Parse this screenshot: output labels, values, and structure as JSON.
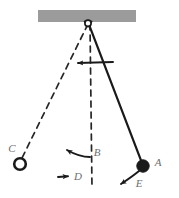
{
  "diagram": {
    "canvas": {
      "width": 179,
      "height": 198,
      "background": "#ffffff"
    },
    "colors": {
      "ceiling_bar": "#9b9b9b",
      "stroke": "#1a1a1a",
      "label": "#6e6e6e",
      "dashed": "#2a2a2a"
    },
    "ceiling": {
      "name": "ceiling-bar",
      "x": 38,
      "y": 10,
      "width": 98,
      "height": 12
    },
    "pivot": {
      "name": "pivot-point",
      "cx": 88,
      "cy": 24,
      "r": 3.2
    },
    "rods": [
      {
        "name": "rod-solid-to-A",
        "style": "solid",
        "x1": 88,
        "y1": 22,
        "x2": 142,
        "y2": 163
      },
      {
        "name": "rod-dashed-to-C",
        "style": "dashed",
        "x1": 88,
        "y1": 24,
        "x2": 22,
        "y2": 158
      },
      {
        "name": "rod-dashed-vertical",
        "style": "dashed",
        "x1": 90,
        "y1": 24,
        "x2": 92,
        "y2": 188
      }
    ],
    "bobs": [
      {
        "name": "bob-filled-A",
        "fill": "solid",
        "cx": 143,
        "cy": 166,
        "r": 6.2
      },
      {
        "name": "bob-open-C",
        "fill": "hollow",
        "cx": 20,
        "cy": 164,
        "r": 6.0
      }
    ],
    "labels": [
      {
        "name": "label-A",
        "text": "A",
        "x": 158,
        "y": 166
      },
      {
        "name": "label-B",
        "text": "B",
        "x": 92,
        "y": 156
      },
      {
        "name": "label-C",
        "text": "C",
        "x": 9,
        "y": 152
      },
      {
        "name": "label-D",
        "text": "D",
        "x": 76,
        "y": 180
      },
      {
        "name": "label-E",
        "text": "E",
        "x": 139,
        "y": 186
      }
    ],
    "arrows": [
      {
        "name": "arrow-top-leftward",
        "description": "straight arrow pointing left near top of swing arc",
        "path": "M 113 62 L 76 63",
        "head_at": [
          74,
          63
        ],
        "head_angle": 182
      },
      {
        "name": "arrow-B-leftward",
        "description": "curved arrow pointing left at label B",
        "path": "M 90 156 C 82 157 74 154 64 149",
        "head_at": [
          62,
          148
        ],
        "head_angle": 207
      },
      {
        "name": "arrow-D-rightward",
        "description": "short arrow pointing right at label D",
        "path": "M 58 177 L 69 176",
        "head_at": [
          72,
          176
        ],
        "head_angle": 355
      },
      {
        "name": "arrow-E-down-left",
        "description": "curved arrow from bob A pointing down-left",
        "path": "M 139 171 C 132 176 126 180 120 184",
        "head_at": [
          116,
          186
        ],
        "head_angle": 213
      }
    ]
  }
}
